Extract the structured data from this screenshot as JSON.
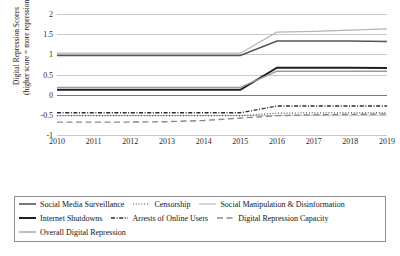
{
  "chart_data": {
    "type": "line",
    "title": "",
    "xlabel": "",
    "ylabel": "Digital Repression Scores\n(higher score = more repression)",
    "ylabel_line1": "Digital Repression Scores",
    "ylabel_line2": "(higher score = more repression)",
    "x": [
      2010,
      2011,
      2012,
      2013,
      2014,
      2015,
      2016,
      2017,
      2018,
      2019
    ],
    "xticklabels": [
      "2010",
      "2011",
      "2012",
      "2013",
      "2014",
      "2015",
      "2016",
      "2017",
      "2018",
      "2019"
    ],
    "ylim": [
      -1,
      2
    ],
    "yticks": [
      -1,
      -0.5,
      0,
      0.5,
      1,
      1.5,
      2
    ],
    "yticklabels": [
      "-1",
      "-0.5",
      "0",
      "0.5",
      "1",
      "1.5",
      "2"
    ],
    "grid": true,
    "legend_position": "below",
    "series": [
      {
        "name": "Social Media Surveillance",
        "style": "solid",
        "width": 1.6,
        "color": "#555555",
        "values": [
          0.97,
          0.97,
          0.97,
          0.97,
          0.97,
          0.97,
          1.33,
          1.33,
          1.33,
          1.32
        ]
      },
      {
        "name": "Censorship",
        "style": "dotted",
        "width": 1.2,
        "color": "#3a3a3a",
        "values": [
          -0.52,
          -0.52,
          -0.52,
          -0.52,
          -0.52,
          -0.52,
          -0.46,
          -0.45,
          -0.45,
          -0.45
        ]
      },
      {
        "name": "Social Manipulation & Disinformation",
        "style": "solid",
        "width": 1.1,
        "color": "#b5b5b5",
        "values": [
          1.03,
          1.03,
          1.03,
          1.03,
          1.03,
          1.03,
          1.55,
          1.57,
          1.6,
          1.63
        ]
      },
      {
        "name": "Internet Shutdowns",
        "style": "solid",
        "width": 2.0,
        "color": "#1f1f1f",
        "values": [
          0.12,
          0.12,
          0.12,
          0.12,
          0.12,
          0.12,
          0.67,
          0.67,
          0.67,
          0.66
        ]
      },
      {
        "name": "Arrests of Online Users",
        "style": "dashdot",
        "width": 1.4,
        "color": "#2e2e2e",
        "values": [
          -0.45,
          -0.45,
          -0.45,
          -0.45,
          -0.45,
          -0.45,
          -0.28,
          -0.28,
          -0.28,
          -0.28
        ]
      },
      {
        "name": "Digital Repression Capacity",
        "style": "longdash",
        "width": 1.4,
        "color": "#8a8a8a",
        "values": [
          -0.68,
          -0.68,
          -0.68,
          -0.67,
          -0.64,
          -0.58,
          -0.52,
          -0.5,
          -0.49,
          -0.48
        ]
      },
      {
        "name": "Overall Digital Repression",
        "style": "solid",
        "width": 1.3,
        "color": "#9a9a9a",
        "values": [
          0.18,
          0.18,
          0.18,
          0.18,
          0.18,
          0.18,
          0.58,
          0.58,
          0.58,
          0.58
        ]
      }
    ]
  },
  "legend": {
    "rows": [
      [
        {
          "name": "Social Media Surveillance",
          "style": "solid",
          "color": "#555555",
          "width": 1.6
        },
        {
          "name": "Censorship",
          "style": "dotted",
          "color": "#3a3a3a",
          "width": 1.2
        },
        {
          "name": "Social Manipulation & Disinformation",
          "style": "solid",
          "color": "#b5b5b5",
          "width": 1.1
        }
      ],
      [
        {
          "name": "Internet Shutdowns",
          "style": "solid",
          "color": "#1f1f1f",
          "width": 2.0
        },
        {
          "name": "Arrests of Online Users",
          "style": "dashdot",
          "color": "#2e2e2e",
          "width": 1.4
        },
        {
          "name": "Digital Repression Capacity",
          "style": "longdash",
          "color": "#8a8a8a",
          "width": 1.4
        }
      ],
      [
        {
          "name": "Overall Digital Repression",
          "style": "solid",
          "color": "#9a9a9a",
          "width": 1.3
        }
      ]
    ]
  }
}
